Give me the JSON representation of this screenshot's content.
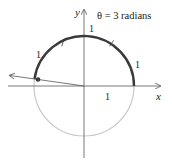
{
  "title": "θ = 3 radians",
  "axes": {
    "x_label": "x",
    "y_label": "y"
  },
  "arc_labels": [
    "1",
    "1",
    "1"
  ],
  "radius_label": "1",
  "angle_radians": 3,
  "colors": {
    "arc": "#3a3a3a",
    "circle": "#c8c8c8",
    "axes": "#555555",
    "text": "#222222"
  }
}
